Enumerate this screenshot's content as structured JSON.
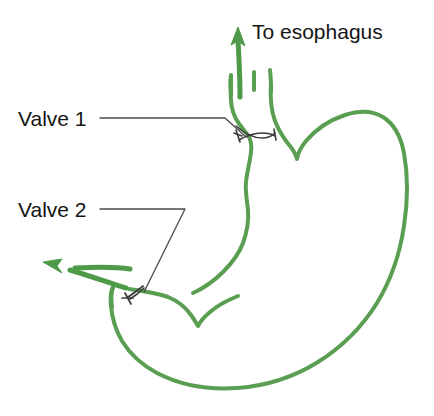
{
  "figure": {
    "width": 434,
    "height": 416,
    "background_color": "#ffffff"
  },
  "colors": {
    "organ_outline": "#5a9e52",
    "flow_arrow": "#4e9a48",
    "leader_line": "#4a4a4a",
    "label_text": "#151515"
  },
  "labels": {
    "esophagus": "To esophagus",
    "valve_1": "Valve 1",
    "valve_2": "Valve 2"
  },
  "annotations": [
    {
      "name": "valve-1",
      "text": "Valve 1",
      "leader_from": [
        100,
        118
      ],
      "leader_to": [
        243,
        133
      ],
      "points_to": "upper stomach sphincter"
    },
    {
      "name": "valve-2",
      "text": "Valve 2",
      "leader_from": [
        100,
        209
      ],
      "leader_to": [
        144,
        288
      ],
      "points_to": "lower stomach sphincter"
    }
  ],
  "arrows": [
    {
      "name": "esophagus-flow-arrow",
      "direction": "up",
      "from": [
        240,
        95
      ],
      "to": [
        238,
        28
      ]
    },
    {
      "name": "outflow-arrow",
      "direction": "left",
      "from": [
        128,
        288
      ],
      "to": [
        44,
        262
      ]
    }
  ],
  "icon_names": {
    "up_arrow": "arrow-up-icon",
    "left_arrow": "arrow-left-icon",
    "organ": "stomach-outline-icon",
    "valve_mark": "valve-sphincter-icon"
  }
}
